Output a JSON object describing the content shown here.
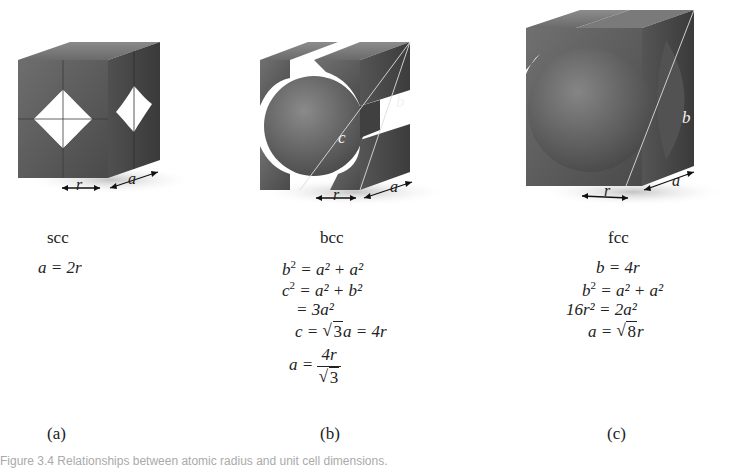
{
  "figure": {
    "panels": [
      {
        "id": "a",
        "letter": "(a)",
        "structure": "scc",
        "dimension_labels": [
          "r",
          "a"
        ],
        "equations": [
          "a = 2r"
        ]
      },
      {
        "id": "b",
        "letter": "(b)",
        "structure": "bcc",
        "dimension_labels": [
          "r",
          "a"
        ],
        "diagonal_labels": [
          "c",
          "b"
        ],
        "equations": {
          "eq1_lhs": "b",
          "eq1_rhs": "= a² + a²",
          "eq2_lhs": "c",
          "eq2_rhs": "= a² + b²",
          "eq3": "= 3a²",
          "eq4_lhs": "c =",
          "eq4_rad": "3",
          "eq4_rhs": "a = 4r",
          "eq5_lhs": "a =",
          "eq5_num": "4r",
          "eq5_den": "3"
        }
      },
      {
        "id": "c",
        "letter": "(c)",
        "structure": "fcc",
        "dimension_labels": [
          "r",
          "a"
        ],
        "diagonal_labels": [
          "b"
        ],
        "equations": {
          "eq1": "b = 4r",
          "eq2_lhs": "b",
          "eq2_rhs": "= a² + a²",
          "eq3": "16r² = 2a²",
          "eq4_lhs": "a =",
          "eq4_rad": "8",
          "eq4_rhs": "r"
        }
      }
    ],
    "caption": "Figure 3.4  Relationships between atomic radius and unit cell dimensions."
  },
  "colors": {
    "cube_face": "#5a5a5a",
    "cube_face_light": "#7a7a7a",
    "cube_face_dark": "#3e3e3e",
    "sphere": "#6a6a6a",
    "background": "#ffffff",
    "text": "#222222"
  }
}
